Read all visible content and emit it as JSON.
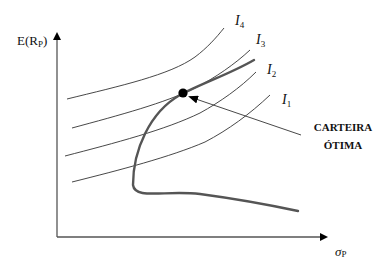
{
  "diagram": {
    "y_axis": {
      "label_main": "E(R",
      "label_sub": "P",
      "label_close": ")"
    },
    "x_axis": {
      "label_main": "σ",
      "label_sub": "P"
    },
    "indifference_curves": [
      {
        "id": "I4",
        "label_main": "I",
        "label_sub": "4"
      },
      {
        "id": "I3",
        "label_main": "I",
        "label_sub": "3"
      },
      {
        "id": "I2",
        "label_main": "I",
        "label_sub": "2"
      },
      {
        "id": "I1",
        "label_main": "I",
        "label_sub": "1"
      }
    ],
    "callout": {
      "line1": "CARTEIRA",
      "line2": "ÓTIMA"
    },
    "colors": {
      "axis": "#555555",
      "indifference": "#333333",
      "frontier": "#555555",
      "point": "#000000"
    }
  }
}
